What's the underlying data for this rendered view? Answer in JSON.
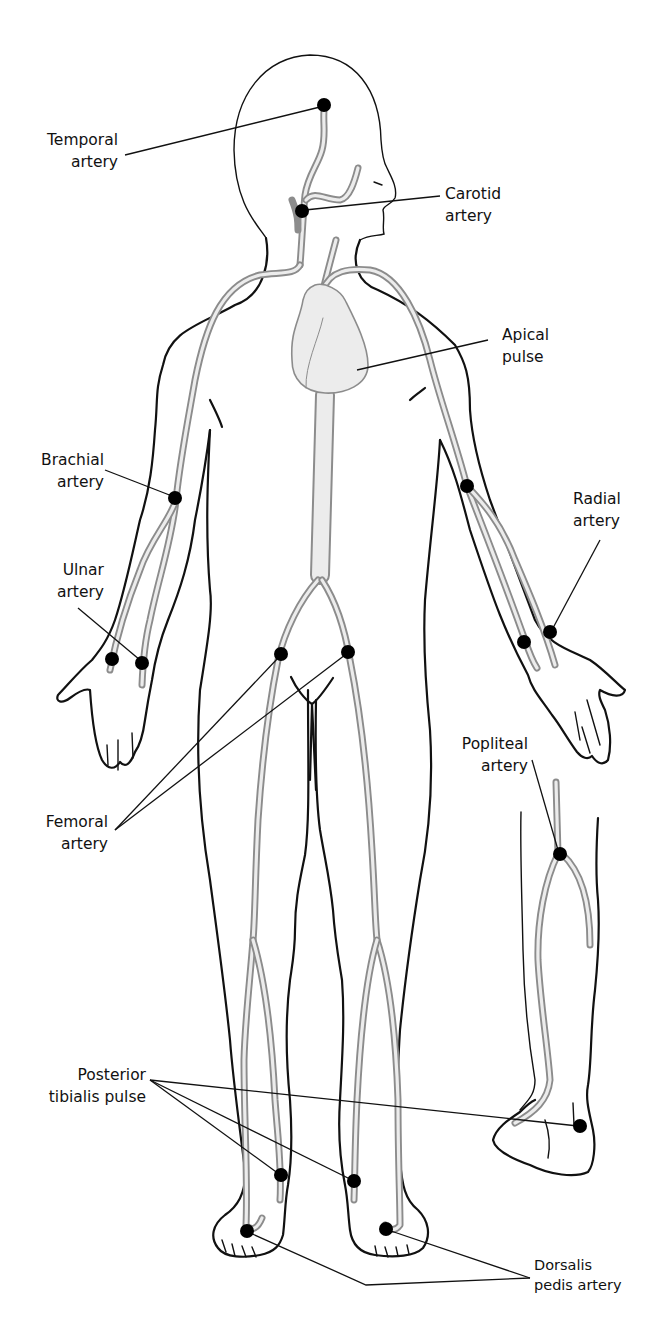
{
  "figure": {
    "colors": {
      "outline": "#111111",
      "artery": "#8c8c8c",
      "artery_fill": "#ececec",
      "pulse_dot": "#000000"
    }
  },
  "labels": {
    "temporal": {
      "line1": "Temporal",
      "line2": "artery"
    },
    "carotid": {
      "line1": "Carotid",
      "line2": "artery"
    },
    "apical": {
      "line1": "Apical",
      "line2": "pulse"
    },
    "brachial": {
      "line1": "Brachial",
      "line2": "artery"
    },
    "radial": {
      "line1": "Radial",
      "line2": "artery"
    },
    "ulnar": {
      "line1": "Ulnar",
      "line2": "artery"
    },
    "popliteal": {
      "line1": "Popliteal",
      "line2": "artery"
    },
    "femoral": {
      "line1": "Femoral",
      "line2": "artery"
    },
    "posterior_tibialis": {
      "line1": "Posterior",
      "line2": "tibialis pulse"
    },
    "dorsalis_pedis": {
      "line1": "Dorsalis",
      "line2": "pedis artery"
    }
  },
  "pulse_points": [
    {
      "name": "temporal",
      "x": 324,
      "y": 105
    },
    {
      "name": "carotid",
      "x": 302,
      "y": 211
    },
    {
      "name": "brachial",
      "x": 175,
      "y": 498
    },
    {
      "name": "radial-left-figure",
      "x": 467,
      "y": 486
    },
    {
      "name": "ulnar-1",
      "x": 112,
      "y": 659
    },
    {
      "name": "ulnar-2",
      "x": 142,
      "y": 663
    },
    {
      "name": "radial-wrist-1",
      "x": 524,
      "y": 642
    },
    {
      "name": "radial-wrist-2",
      "x": 550,
      "y": 632
    },
    {
      "name": "femoral-left",
      "x": 281,
      "y": 654
    },
    {
      "name": "femoral-right",
      "x": 348,
      "y": 652
    },
    {
      "name": "popliteal",
      "x": 560,
      "y": 854
    },
    {
      "name": "posterior-tibialis-left",
      "x": 281,
      "y": 1175
    },
    {
      "name": "posterior-tibialis-right",
      "x": 354,
      "y": 1181
    },
    {
      "name": "posterior-tibialis-side",
      "x": 580,
      "y": 1126
    },
    {
      "name": "dorsalis-pedis-left",
      "x": 247,
      "y": 1231
    },
    {
      "name": "dorsalis-pedis-right",
      "x": 386,
      "y": 1229
    }
  ]
}
